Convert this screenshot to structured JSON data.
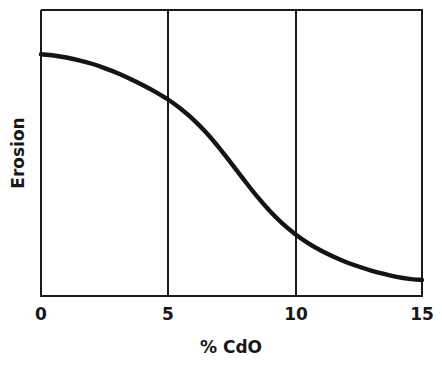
{
  "chart_data": {
    "type": "line",
    "title": "",
    "subtitle": "",
    "xlabel": "% CdO",
    "ylabel": "Erosion",
    "xlim": [
      0,
      15
    ],
    "ylim": [
      0,
      1
    ],
    "grid": true,
    "legend": null,
    "xticks": [
      0,
      5,
      10,
      15
    ],
    "xtick_labels": [
      "0",
      "5",
      "10",
      "15"
    ],
    "yticks": [],
    "ytick_labels": [],
    "annotations": [],
    "series": [
      {
        "name": "Erosion vs % CdO",
        "color": "#141414",
        "x": [
          0,
          0.5,
          1,
          1.5,
          2,
          2.5,
          3,
          3.5,
          4,
          4.5,
          5,
          5.5,
          6,
          6.5,
          7,
          7.5,
          8,
          8.5,
          9,
          9.5,
          10,
          10.5,
          11,
          11.5,
          12,
          12.5,
          13,
          13.5,
          14,
          14.5,
          15
        ],
        "y": [
          0.845,
          0.841,
          0.834,
          0.824,
          0.812,
          0.797,
          0.78,
          0.76,
          0.738,
          0.714,
          0.687,
          0.655,
          0.617,
          0.572,
          0.52,
          0.463,
          0.405,
          0.349,
          0.298,
          0.254,
          0.217,
          0.186,
          0.16,
          0.138,
          0.119,
          0.103,
          0.089,
          0.077,
          0.067,
          0.06,
          0.056
        ]
      }
    ]
  },
  "axis": {
    "x_title": "% CdO",
    "y_title": "Erosion",
    "tick_0": "0",
    "tick_5": "5",
    "tick_10": "10",
    "tick_15": "15"
  },
  "colors": {
    "background": "#ffffff",
    "frame": "#1a1a1a",
    "curve": "#141414",
    "text": "#171717"
  }
}
